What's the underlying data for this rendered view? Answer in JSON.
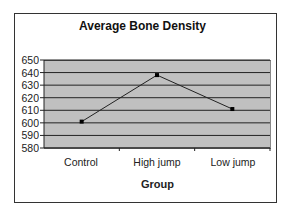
{
  "chart_data": {
    "type": "line",
    "title": "Average Bone Density",
    "xlabel": "Group",
    "ylabel": "",
    "categories": [
      "Control",
      "High jump",
      "Low jump"
    ],
    "series": [
      {
        "name": "Average Bone Density",
        "values": [
          601,
          638,
          611
        ]
      }
    ],
    "ylim": [
      580,
      650
    ],
    "yticks": [
      "650",
      "640",
      "630",
      "620",
      "610",
      "600",
      "590",
      "580"
    ],
    "grid": true,
    "legend": "none",
    "plot_background": "#c0c0c0"
  }
}
